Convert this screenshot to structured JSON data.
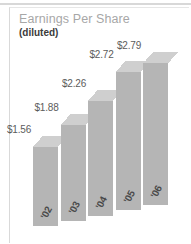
{
  "panel": {
    "title": "Earnings Per Share",
    "subtitle": "(diluted)"
  },
  "chart_data": {
    "type": "bar",
    "title": "Earnings Per Share",
    "subtitle": "(diluted)",
    "categories": [
      "'02",
      "'03",
      "'04",
      "'05",
      "'06"
    ],
    "values": [
      1.56,
      1.88,
      2.26,
      2.72,
      2.79
    ],
    "data_labels": [
      "$1.56",
      "$1.88",
      "$2.26",
      "$2.72",
      "$2.79"
    ],
    "xlabel": "",
    "ylabel": "",
    "ylim": [
      0,
      2.95
    ],
    "grid": false,
    "legend": null,
    "style": "3d-isometric-columns",
    "colors": {
      "bar_front": "#b5b5b5",
      "bar_top": "#cfcfcf",
      "bar_side": "#8e8e8e",
      "title_text": "#a7a7a7",
      "subtitle_text": "#3b3b3b",
      "value_label_text": "#5c5c5c",
      "category_label_text": "#4a4a4a",
      "panel_background": "#ffffff",
      "panel_border": "#d9d9d9"
    }
  }
}
